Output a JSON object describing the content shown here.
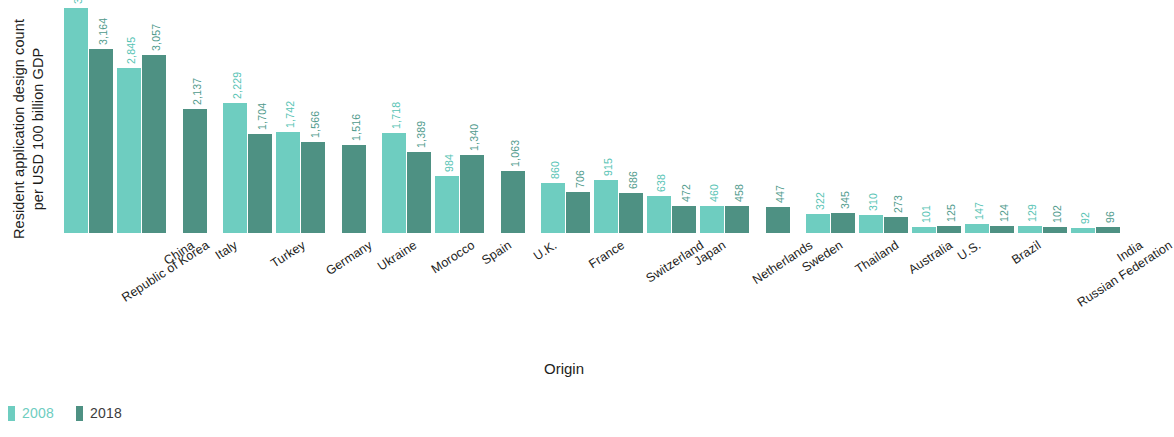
{
  "chart_data": {
    "type": "bar",
    "title": "",
    "xlabel": "Origin",
    "ylabel": "Resident application design count\nper USD 100 billion GDP",
    "ylim": [
      0,
      3870
    ],
    "grid": false,
    "legend_position": "bottom-left",
    "categories": [
      "Republic of Korea",
      "China",
      "Italy",
      "Turkey",
      "Germany",
      "Ukraine",
      "Morocco",
      "Spain",
      "U.K.",
      "France",
      "Switzerland",
      "Japan",
      "Netherlands",
      "Sweden",
      "Thailand",
      "Australia",
      "U.S.",
      "Brazil",
      "Russian Federation",
      "India"
    ],
    "series": [
      {
        "name": "2008",
        "color": "#6ecdc0",
        "values": [
          3870,
          2845,
          null,
          2229,
          1742,
          null,
          1718,
          984,
          null,
          860,
          915,
          638,
          460,
          null,
          322,
          310,
          101,
          147,
          129,
          92
        ],
        "labels": [
          "3,870",
          "2,845",
          "",
          "2,229",
          "1,742",
          "",
          "1,718",
          "984",
          "",
          "860",
          "915",
          "638",
          "460",
          "",
          "322",
          "310",
          "101",
          "147",
          "129",
          "92"
        ]
      },
      {
        "name": "2018",
        "color": "#4e9183",
        "values": [
          3164,
          3057,
          2137,
          1704,
          1566,
          1516,
          1389,
          1340,
          1063,
          706,
          686,
          472,
          458,
          447,
          345,
          273,
          125,
          124,
          102,
          96
        ],
        "labels": [
          "3,164",
          "3,057",
          "2,137",
          "1,704",
          "1,566",
          "1,516",
          "1,389",
          "1,340",
          "1,063",
          "706",
          "686",
          "472",
          "458",
          "447",
          "345",
          "273",
          "125",
          "124",
          "102",
          "96"
        ]
      }
    ]
  },
  "legend": {
    "items": [
      {
        "label": "2008",
        "color": "#6ecdc0"
      },
      {
        "label": "2018",
        "color": "#4e9183"
      }
    ]
  },
  "axes": {
    "y_title": "Resident application design count\nper USD 100 billion GDP",
    "x_title": "Origin"
  }
}
